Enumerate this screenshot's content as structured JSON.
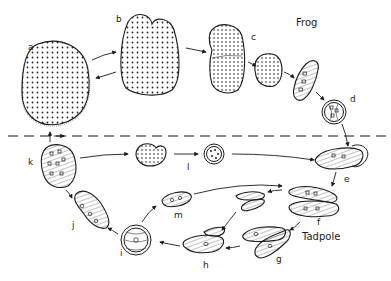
{
  "diagram": {
    "type": "biological life cycle",
    "regions": {
      "upper": "Frog",
      "lower": "Tadpole"
    },
    "divider": "dashed horizontal line separating host stages",
    "stages": [
      {
        "id": "a",
        "label": "a",
        "description": "large multinucleate trophont"
      },
      {
        "id": "b",
        "label": "b",
        "description": "dividing trophont"
      },
      {
        "id": "c",
        "label": "c",
        "description": "repeated fission, smaller cells"
      },
      {
        "id": "d",
        "label": "d",
        "description": "cyst"
      },
      {
        "id": "e",
        "label": "e",
        "description": "excystment in tadpole"
      },
      {
        "id": "f",
        "label": "f",
        "description": "gamonts"
      },
      {
        "id": "g",
        "label": "g",
        "description": "gametes"
      },
      {
        "id": "h",
        "label": "h",
        "description": "syngamy"
      },
      {
        "id": "i",
        "label": "i",
        "description": "zygote cyst"
      },
      {
        "id": "j",
        "label": "j",
        "description": "young trophont"
      },
      {
        "id": "k",
        "label": "k",
        "description": "trophont returning to frog"
      },
      {
        "id": "l",
        "label": "l",
        "description": "small cyst"
      },
      {
        "id": "m",
        "label": "m",
        "description": "excysted zygote"
      }
    ],
    "arrow_hint": "arrows show direction of life-cycle progression"
  }
}
